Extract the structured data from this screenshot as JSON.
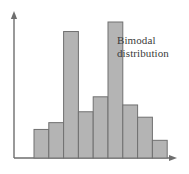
{
  "figure": {
    "background_color": "#ffffff",
    "annotation": {
      "text": "Bimodal\ndistribution",
      "line1": "Bimodal",
      "line2": "distribution",
      "color": "#3b3b3b"
    }
  },
  "chart_data": {
    "type": "bar",
    "title": "",
    "subtitle": "",
    "xlabel": "",
    "ylabel": "",
    "annotations": [
      "Bimodal distribution"
    ],
    "grid": false,
    "legend": null,
    "axis": {
      "x_arrow": true,
      "y_arrow": true,
      "axis_color": "#6e6e6e",
      "x_range": [
        0,
        9.5
      ],
      "y_range": [
        0,
        10
      ]
    },
    "style": {
      "bar_fill": "#b4b4b4",
      "bar_edge": "#707070",
      "bar_gap": 0
    },
    "categories": [
      "1",
      "2",
      "3",
      "4",
      "5",
      "6",
      "7",
      "8",
      "9"
    ],
    "values": [
      2.1,
      2.6,
      9.3,
      3.4,
      4.5,
      10.0,
      3.9,
      3.0,
      1.3
    ],
    "ylim": [
      0,
      10
    ]
  }
}
